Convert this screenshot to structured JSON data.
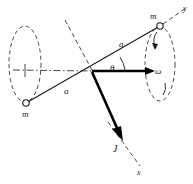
{
  "figure": {
    "background_color": "#ffffff",
    "stroke_color": "#1a1a1a",
    "width": 193,
    "height": 184
  },
  "labels": {
    "mass_top": "m",
    "mass_bottom": "m",
    "arm_top": "a",
    "arm_bottom": "a",
    "angle": "θ",
    "omega": "ω",
    "angular_momentum": "J",
    "axis_y": "y",
    "axis_x": "x"
  },
  "elements": {
    "rod": "rigid-rod-through-origin",
    "origin": "center-pivot",
    "orbit_left": "dashed-ellipse-left",
    "orbit_right": "dashed-ellipse-right",
    "spin_axis": "horizontal-dash-dot-axis",
    "symmetry_line": "dashed-line-upper-left",
    "vector_omega": "angular-velocity-vector",
    "vector_J": "angular-momentum-vector",
    "arc_theta": "angle-arc-between-rod-and-omega",
    "spin_arrow_top": "small-curved-spin-arrow-top",
    "spin_arrow_bottom": "small-curved-spin-arrow-bottom"
  }
}
